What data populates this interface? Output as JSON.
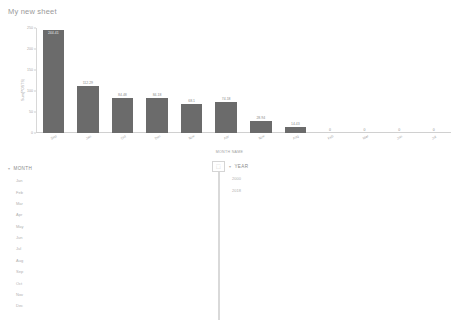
{
  "sheet": {
    "title": "My new sheet"
  },
  "chart_data": {
    "type": "bar",
    "title": "",
    "xlabel": "MONTH NAME",
    "ylabel": "Sum(POSTS)",
    "categories": [
      "Sep",
      "Jan",
      "Oct",
      "Dec",
      "Nov",
      "Apr",
      "Nov",
      "Aug",
      "Feb",
      "Mar",
      "Jun",
      "Jul"
    ],
    "values": [
      244.41,
      112.29,
      84.48,
      84.18,
      68.1,
      74.18,
      28.94,
      14.43,
      0,
      0,
      0,
      0
    ],
    "value_labels": [
      "244.41",
      "112.29",
      "84.48",
      "84.18",
      "68.1",
      "74.18",
      "28.94",
      "14.43",
      "0",
      "0",
      "0",
      "0"
    ],
    "yticks": [
      "250",
      "200",
      "150",
      "100",
      "50",
      "0"
    ],
    "ytick_values": [
      250,
      200,
      150,
      100,
      50,
      0
    ],
    "ylim": [
      0,
      250
    ],
    "grid": false,
    "legend": "none",
    "bar_color": "#6b6b6b"
  },
  "month_filter": {
    "header": "MONTH",
    "caret": "▾",
    "items": [
      "Jan",
      "Feb",
      "Mar",
      "Apr",
      "May",
      "Jun",
      "Jul",
      "Aug",
      "Sep",
      "Oct",
      "Nov",
      "Dec"
    ]
  },
  "year_filter": {
    "header": "YEAR",
    "caret": "▾",
    "handle_glyph": "⬚",
    "items": [
      "2000",
      "2018"
    ]
  }
}
